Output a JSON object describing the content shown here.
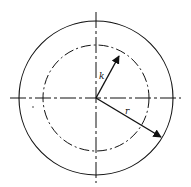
{
  "diagram": {
    "type": "concentric-circles-with-vectors",
    "colors": {
      "stroke": "#111111",
      "background": "#ffffff"
    },
    "center": [
      96,
      98
    ],
    "outer_circle": {
      "radius": 77,
      "style": "solid"
    },
    "inner_circle": {
      "radius": 53,
      "style": "dash-dot"
    },
    "axes": {
      "horizontal": {
        "x1": 10,
        "x2": 181,
        "y": 98,
        "style": "dash-dot"
      },
      "vertical": {
        "x": 96,
        "y1": 12,
        "y2": 183,
        "style": "dash-dot"
      }
    },
    "vectors": [
      {
        "label": "k",
        "to": [
          119,
          56
        ],
        "label_pos": [
          99,
          79
        ]
      },
      {
        "label": "r",
        "to": [
          161,
          137
        ],
        "label_pos": [
          125,
          114
        ]
      }
    ]
  }
}
